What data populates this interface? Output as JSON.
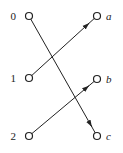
{
  "diagram": {
    "type": "bipartite-mapping",
    "left_nodes": [
      {
        "id": "0",
        "label": "0",
        "x": 29,
        "y": 16
      },
      {
        "id": "1",
        "label": "1",
        "x": 29,
        "y": 78
      },
      {
        "id": "2",
        "label": "2",
        "x": 29,
        "y": 136
      }
    ],
    "right_nodes": [
      {
        "id": "a",
        "label": "a",
        "x": 97,
        "y": 16
      },
      {
        "id": "b",
        "label": "b",
        "x": 97,
        "y": 79
      },
      {
        "id": "c",
        "label": "c",
        "x": 97,
        "y": 136
      }
    ],
    "edges": [
      {
        "from": "0",
        "to": "c"
      },
      {
        "from": "1",
        "to": "a"
      },
      {
        "from": "2",
        "to": "b"
      }
    ]
  }
}
